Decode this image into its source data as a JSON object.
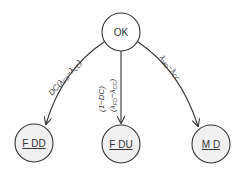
{
  "diagram": {
    "type": "state-transition",
    "colors": {
      "stroke": "#333333",
      "start_fill": "#ffffff",
      "end_fill": "#f0f0f0",
      "text": "#333333"
    },
    "nodes": [
      {
        "id": "ok",
        "label": "OK",
        "underlined": false
      },
      {
        "id": "fdd",
        "label": "F DD",
        "underlined": true
      },
      {
        "id": "fdu",
        "label": "F DU",
        "underlined": true
      },
      {
        "id": "md",
        "label": "M D",
        "underlined": true
      }
    ],
    "edges": [
      {
        "from": "ok",
        "to": "fdd",
        "label": "DC(λFD−λCC)"
      },
      {
        "from": "ok",
        "to": "fdu",
        "label_line1": "(1−DC)",
        "label_line2": "(λFD−λCC)"
      },
      {
        "from": "ok",
        "to": "md",
        "label": "λMD−λCC"
      }
    ]
  }
}
